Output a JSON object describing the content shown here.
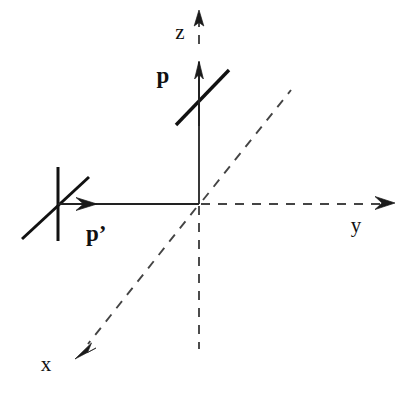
{
  "figure": {
    "kind": "vector-coordinate-diagram",
    "background_color": "#ffffff",
    "line_color": "#222222",
    "dashed_color": "#444444",
    "label_color": "#111111",
    "width": 412,
    "height": 402
  },
  "axes": {
    "origin": {
      "x": 199,
      "y": 204
    },
    "z": {
      "label": "z",
      "label_x": 180,
      "label_y": 39,
      "style": "mixed-solid-dashed",
      "arrow_tip": {
        "x": 199,
        "y": 11
      },
      "dashed_top_from": {
        "x": 199,
        "y": 18
      },
      "dashed_top_to": {
        "x": 199,
        "y": 46
      },
      "solid_from": {
        "x": 199,
        "y": 62
      },
      "solid_to": {
        "x": 199,
        "y": 204
      },
      "dashed_bottom_from": {
        "x": 199,
        "y": 204
      },
      "dashed_bottom_to": {
        "x": 199,
        "y": 349
      }
    },
    "y": {
      "label": "y",
      "label_x": 356,
      "label_y": 232,
      "style": "dashed",
      "from": {
        "x": 199,
        "y": 204
      },
      "to": {
        "x": 392,
        "y": 204
      },
      "arrow_tip": {
        "x": 394,
        "y": 203
      }
    },
    "x": {
      "label": "x",
      "label_x": 46,
      "label_y": 371,
      "style": "dashed",
      "from": {
        "x": 199,
        "y": 204
      },
      "to": {
        "x": 79,
        "y": 354
      },
      "arrow_tip": {
        "x": 76,
        "y": 358
      },
      "negative_from": {
        "x": 199,
        "y": 204
      },
      "negative_to": {
        "x": 291,
        "y": 90
      }
    }
  },
  "vectors": [
    {
      "name": "p",
      "label": "p",
      "label_x": 163,
      "label_y": 83,
      "description": "incoming momentum along +z with transverse spin bar",
      "arrow_from": {
        "x": 199,
        "y": 128
      },
      "arrow_to": {
        "x": 199,
        "y": 62
      },
      "spin_bar_from": {
        "x": 176,
        "y": 124
      },
      "spin_bar_to": {
        "x": 229,
        "y": 71
      }
    },
    {
      "name": "p-prime",
      "label": "p’",
      "label_x": 86,
      "label_y": 241,
      "description": "outgoing momentum along -y with spin cross marker",
      "arrow_from": {
        "x": 58,
        "y": 204
      },
      "arrow_to": {
        "x": 96,
        "y": 204
      },
      "tail_line_from": {
        "x": 96,
        "y": 204
      },
      "tail_line_to": {
        "x": 199,
        "y": 204
      },
      "spin_vertical_from": {
        "x": 58,
        "y": 167
      },
      "spin_vertical_to": {
        "x": 58,
        "y": 241
      },
      "spin_bar_from": {
        "x": 22,
        "y": 239
      },
      "spin_bar_to": {
        "x": 89,
        "y": 177
      }
    }
  ],
  "strokes": {
    "axis_solid_width": 1.8,
    "axis_dashed_width": 1.9,
    "dash_pattern": "9 8",
    "vector_width": 2.2,
    "spin_bar_width": 3.4
  }
}
